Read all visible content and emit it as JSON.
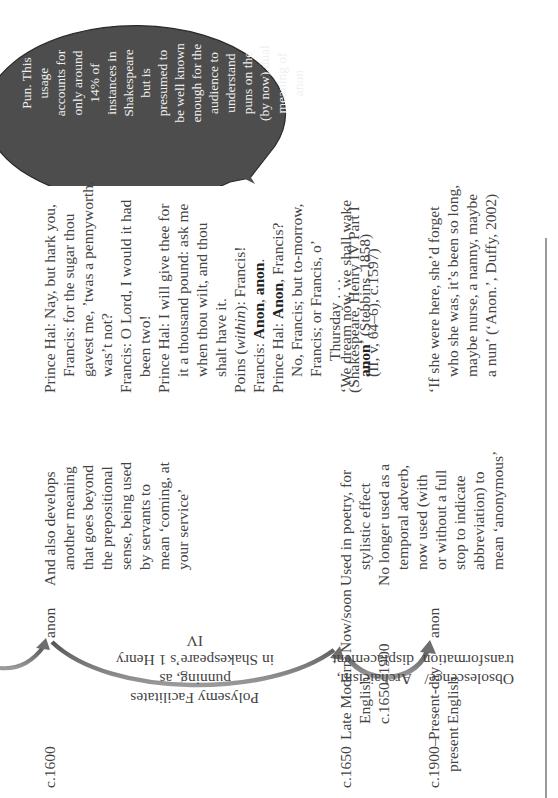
{
  "bubble": {
    "lines": [
      "Pun. This",
      "usage",
      "accounts for",
      "only around",
      "14% of",
      "instances in",
      "Shakespeare",
      "but is",
      "presumed to",
      "be well known",
      "enough for the",
      "audience to",
      "understand",
      "puns on the",
      "(by now) dual",
      "meaning of",
      "anon"
    ],
    "fill_color": "#4d4d4d"
  },
  "rows": [
    {
      "date": "c.1600",
      "period": "",
      "form": "anon",
      "description": [
        "And also develops",
        "another meaning",
        "that goes beyond",
        "the prepositional",
        "sense, being used",
        "by servants to",
        "mean ‘coming, at",
        "your service’"
      ],
      "quote": {
        "l1": "Prince Hal: Nay, but hark you,",
        "l2": "Francis: for the sugar thou",
        "l3": "gavest me, ’twas a pennyworth,",
        "l4": "was’t not?",
        "l5": "Francis: O Lord, I would it had",
        "l6": "been two!",
        "l7": "Prince Hal: I will give thee for",
        "l8": "it a thousand pound: ask me",
        "l9": "when thou wilt, and thou",
        "l10": "shalt have it.",
        "l11a": "Poins (",
        "l11b": "within",
        "l11c": "): Francis!",
        "l12a": "Francis: ",
        "l12b": "Anon",
        "l12c": ", ",
        "l12d": "anon",
        "l12e": ".",
        "l13a": "Prince Hal: ",
        "l13b": "Anon",
        "l13c": ", Francis?",
        "l14": "No, Francis; but to-morrow,",
        "l15": "Francis; or Francis, o’",
        "l16": "Thursday . . .",
        "l17": "(Shakespeare, Henry IV Part I",
        "l18": "(II, v, 64–6), c.1597)"
      }
    },
    {
      "date": "c.1650",
      "period": [
        "Late Modern",
        "English,",
        "c.1650–1900"
      ],
      "form": "Now/soon",
      "description": [
        "Used in poetry, for",
        "stylistic effect",
        "No longer used as a",
        "temporal adverb,",
        "now used (with",
        "or without a full",
        "stop to indicate",
        "abbreviation) to",
        "mean ‘anonymous’"
      ],
      "quote": {
        "l1": "‘We dream now, we shall wake",
        "l2a": "anon",
        "l2b": "’ (Stebbins, 1858)"
      }
    },
    {
      "date": [
        "c.1900–",
        "present"
      ],
      "period": [
        "Present-day",
        "English"
      ],
      "form": "anon",
      "quote": {
        "l1": "‘If she were here, she’d forget",
        "l2": "who she was, it’s been so long,",
        "l3": "maybe nurse, a nanny, maybe",
        "l4": "a nun’ (‘Anon.’, Duffy, 2002)"
      }
    }
  ],
  "transitions": {
    "polysemy": [
      "Polysemy Facilitates punning, as",
      "in Shakespeare’s 1 Henry IV"
    ],
    "archaicism": [
      "Archaicism,",
      "displacement"
    ],
    "obsolescence": [
      "Obsolescence/",
      "transformation"
    ]
  },
  "arrow_color": "#6e6e6e",
  "page_number": "178"
}
